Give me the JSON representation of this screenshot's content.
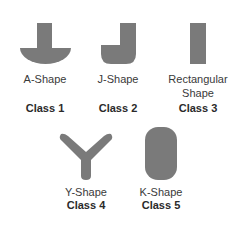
{
  "colors": {
    "shape_fill": "#7a7a7a",
    "text": "#3a3a3a"
  },
  "items": [
    {
      "shape": "A-Shape",
      "shape_line2": "",
      "class": "Class 1"
    },
    {
      "shape": "J-Shape",
      "shape_line2": "",
      "class": "Class 2"
    },
    {
      "shape": "Rectangular",
      "shape_line2": "Shape",
      "class": "Class 3"
    },
    {
      "shape": "Y-Shape",
      "shape_line2": "",
      "class": "Class 4"
    },
    {
      "shape": "K-Shape",
      "shape_line2": "",
      "class": "Class 5"
    }
  ]
}
